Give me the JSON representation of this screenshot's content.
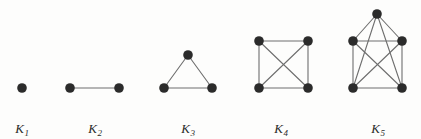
{
  "figure": {
    "background_color": "#fdfdfc",
    "vertex_color": "#2b2b2b",
    "edge_color": "#6e6e6e",
    "label_color": "#2b2b2b",
    "width": 421,
    "height": 139
  },
  "diagram_data": {
    "type": "graph-diagram",
    "description": "Five complete graphs drawn left to right, each with all vertices pairwise connected",
    "vertex_radius": 4.8,
    "edge_width": 1.1,
    "graphs": [
      {
        "id": "K1",
        "label_base": "K",
        "label_subscript": "1",
        "order": 1,
        "size": 0,
        "label_x": 22,
        "label_y": 122,
        "vertices": [
          {
            "name": "v1",
            "x": 22,
            "y": 88
          }
        ],
        "edges": []
      },
      {
        "id": "K2",
        "label_base": "K",
        "label_subscript": "2",
        "order": 2,
        "size": 1,
        "label_x": 95,
        "label_y": 122,
        "vertices": [
          {
            "name": "v1",
            "x": 70,
            "y": 88
          },
          {
            "name": "v2",
            "x": 119,
            "y": 88
          }
        ],
        "edges": [
          [
            0,
            1
          ]
        ]
      },
      {
        "id": "K3",
        "label_base": "K",
        "label_subscript": "3",
        "order": 3,
        "size": 3,
        "label_x": 188,
        "label_y": 122,
        "vertices": [
          {
            "name": "v1",
            "x": 188,
            "y": 55
          },
          {
            "name": "v2",
            "x": 164,
            "y": 88
          },
          {
            "name": "v3",
            "x": 212,
            "y": 88
          }
        ],
        "edges": [
          [
            0,
            1
          ],
          [
            0,
            2
          ],
          [
            1,
            2
          ]
        ]
      },
      {
        "id": "K4",
        "label_base": "K",
        "label_subscript": "4",
        "order": 4,
        "size": 6,
        "label_x": 281,
        "label_y": 122,
        "vertices": [
          {
            "name": "v1",
            "x": 259,
            "y": 41
          },
          {
            "name": "v2",
            "x": 308,
            "y": 41
          },
          {
            "name": "v3",
            "x": 259,
            "y": 88
          },
          {
            "name": "v4",
            "x": 308,
            "y": 88
          }
        ],
        "edges": [
          [
            0,
            1
          ],
          [
            0,
            2
          ],
          [
            0,
            3
          ],
          [
            1,
            2
          ],
          [
            1,
            3
          ],
          [
            2,
            3
          ]
        ]
      },
      {
        "id": "K5",
        "label_base": "K",
        "label_subscript": "5",
        "order": 5,
        "size": 10,
        "label_x": 378,
        "label_y": 122,
        "vertices": [
          {
            "name": "v1",
            "x": 377,
            "y": 14
          },
          {
            "name": "v2",
            "x": 353,
            "y": 41
          },
          {
            "name": "v3",
            "x": 402,
            "y": 41
          },
          {
            "name": "v4",
            "x": 353,
            "y": 88
          },
          {
            "name": "v5",
            "x": 402,
            "y": 88
          }
        ],
        "edges": [
          [
            0,
            1
          ],
          [
            0,
            2
          ],
          [
            0,
            3
          ],
          [
            0,
            4
          ],
          [
            1,
            2
          ],
          [
            1,
            3
          ],
          [
            1,
            4
          ],
          [
            2,
            3
          ],
          [
            2,
            4
          ],
          [
            3,
            4
          ]
        ]
      }
    ]
  }
}
